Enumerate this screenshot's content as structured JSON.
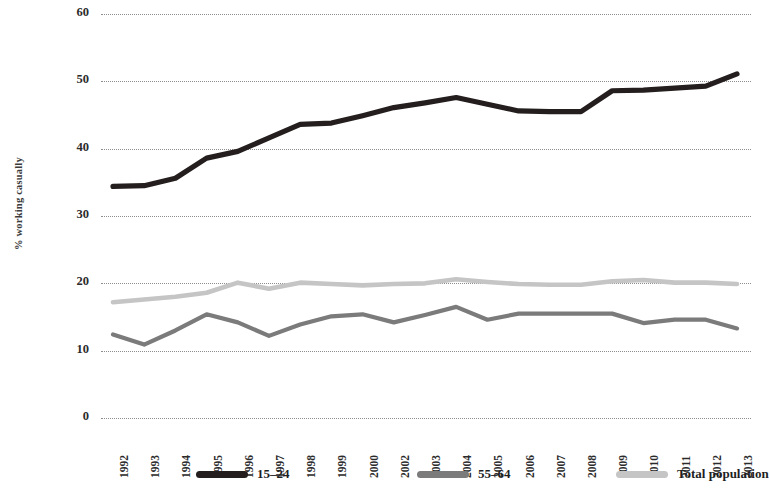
{
  "chart_data": {
    "type": "line",
    "title": "",
    "xlabel": "",
    "ylabel": "% working casually",
    "ylim": [
      0,
      60
    ],
    "ytick_values": [
      60,
      50,
      40,
      30,
      20,
      10,
      0
    ],
    "grid": "horizontal dotted gridlines only",
    "legend_position": "bottom",
    "categories": [
      "1992",
      "1993",
      "1994",
      "1995",
      "1996",
      "1997",
      "1998",
      "1999",
      "2000",
      "2002",
      "2003",
      "2004",
      "2005",
      "2006",
      "2007",
      "2008",
      "2009",
      "2010",
      "2011",
      "2012",
      "2013"
    ],
    "series": [
      {
        "name": "15–24",
        "color": "#241f1e",
        "values": [
          34.4,
          34.5,
          35.6,
          38.6,
          39.6,
          41.6,
          43.6,
          43.8,
          44.9,
          46.1,
          46.8,
          47.6,
          46.6,
          45.6,
          45.5,
          45.5,
          48.6,
          48.7,
          49.0,
          49.3,
          51.1
        ]
      },
      {
        "name": "55–64",
        "color": "#7b7b7b",
        "values": [
          12.4,
          10.9,
          13.0,
          15.4,
          14.2,
          12.2,
          13.9,
          15.1,
          15.4,
          14.2,
          15.3,
          16.5,
          14.6,
          15.5,
          15.5,
          15.5,
          15.5,
          14.1,
          14.6,
          14.6,
          13.3
        ]
      },
      {
        "name": "Total population",
        "color": "#c5c5c5",
        "values": [
          17.2,
          17.6,
          18.0,
          18.6,
          20.1,
          19.2,
          20.1,
          19.9,
          19.7,
          19.9,
          20.0,
          20.6,
          20.2,
          19.9,
          19.8,
          19.8,
          20.3,
          20.5,
          20.1,
          20.1,
          19.9
        ]
      }
    ]
  },
  "legend": {
    "items": [
      {
        "label": "15–24",
        "color": "#241f1e",
        "icon": "line-swatch-icon"
      },
      {
        "label": "55–64",
        "color": "#7b7b7b",
        "icon": "line-swatch-icon"
      },
      {
        "label": "Total population",
        "color": "#c5c5c5",
        "icon": "line-swatch-icon"
      }
    ]
  }
}
